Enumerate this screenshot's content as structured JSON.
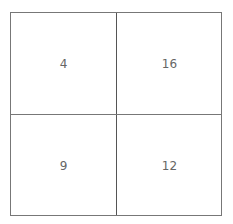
{
  "grid": {
    "rows": 2,
    "cols": 2,
    "cells": [
      {
        "row": 0,
        "col": 0,
        "value": "4"
      },
      {
        "row": 0,
        "col": 1,
        "value": "16"
      },
      {
        "row": 1,
        "col": 0,
        "value": "9"
      },
      {
        "row": 1,
        "col": 1,
        "value": "12"
      }
    ]
  },
  "colors": {
    "border": "#777777",
    "text": "#666666",
    "background": "#ffffff"
  }
}
